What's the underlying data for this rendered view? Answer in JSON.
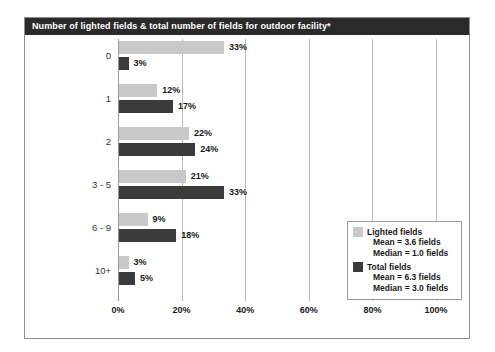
{
  "chart_data": {
    "type": "bar",
    "orientation": "horizontal",
    "title": "Number of lighted fields & total number of fields for outdoor facility*",
    "xlabel": "",
    "ylabel": "",
    "xlim": [
      0,
      100
    ],
    "grid": true,
    "legend_position": "inside-right",
    "categories": [
      "0",
      "1",
      "2",
      "3 - 5",
      "6 - 9",
      "10+"
    ],
    "tick_labels": [
      "0%",
      "20%",
      "40%",
      "60%",
      "80%",
      "100%"
    ],
    "tick_values": [
      0,
      20,
      40,
      60,
      80,
      100
    ],
    "series": [
      {
        "name": "Lighted fields",
        "color": "#c9c9c9",
        "values": [
          33,
          12,
          22,
          21,
          9,
          3
        ],
        "value_labels": [
          "33%",
          "12%",
          "22%",
          "21%",
          "9%",
          "3%"
        ],
        "mean": "Mean = 3.6 fields",
        "median": "Median = 1.0 fields"
      },
      {
        "name": "Total fields",
        "color": "#3b3b3b",
        "values": [
          3,
          17,
          24,
          33,
          18,
          5
        ],
        "value_labels": [
          "3%",
          "17%",
          "24%",
          "33%",
          "18%",
          "5%"
        ],
        "mean": "Mean = 6.3 fields",
        "median": "Median = 3.0 fields"
      }
    ]
  },
  "legend": {
    "lighted": {
      "label": "Lighted fields",
      "mean": "Mean = 3.6 fields",
      "median": "Median = 1.0 fields"
    },
    "total": {
      "label": "Total fields",
      "mean": "Mean = 6.3 fields",
      "median": "Median = 3.0 fields"
    }
  },
  "colors": {
    "title_bar": "#2a2a2a",
    "light_series": "#c9c9c9",
    "dark_series": "#3b3b3b",
    "gridline": "#b9b9b9",
    "frame_border": "#8e8e8e"
  }
}
